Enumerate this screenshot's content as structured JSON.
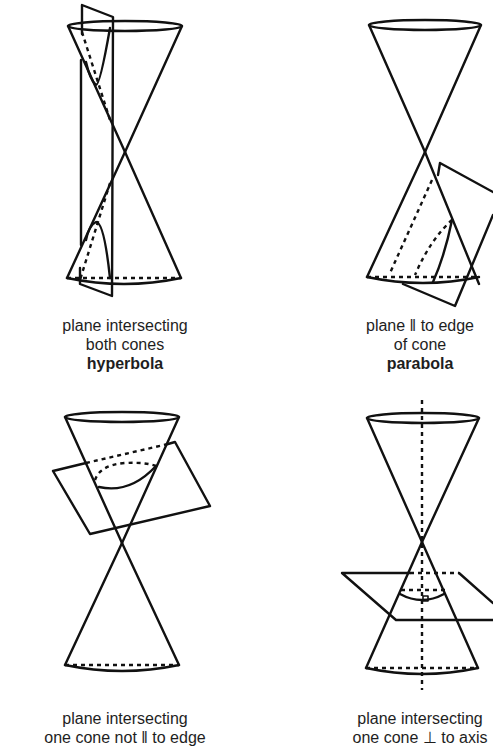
{
  "panels": [
    {
      "id": "hyperbola",
      "caption_lines": [
        "plane intersecting",
        "both cones"
      ],
      "result": "hyperbola"
    },
    {
      "id": "parabola",
      "caption_lines": [
        "plane ‖ to edge",
        "of cone"
      ],
      "result": "parabola"
    },
    {
      "id": "ellipse",
      "caption_lines": [
        "plane intersecting",
        "one cone not ‖ to edge"
      ],
      "result": ""
    },
    {
      "id": "circle",
      "caption_lines": [
        "plane intersecting",
        "one cone ⊥ to axis"
      ],
      "result": ""
    }
  ]
}
